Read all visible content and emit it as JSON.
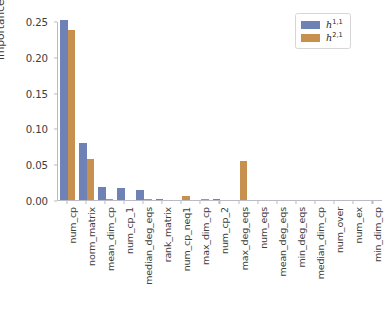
{
  "chart_data": {
    "type": "bar",
    "title": "",
    "xlabel": "",
    "ylabel": "importance (%)",
    "ylim": [
      0.0,
      0.25
    ],
    "yticks": [
      "0.00",
      "0.05",
      "0.10",
      "0.15",
      "0.20",
      "0.25"
    ],
    "ytick_values": [
      0.0,
      0.05,
      0.1,
      0.15,
      0.2,
      0.25
    ],
    "grid": false,
    "legend_position": "upper right",
    "categories": [
      "num_cp",
      "norm_matrix",
      "mean_dim_cp",
      "num_cp_1",
      "median_deg_eqs",
      "rank_matrix",
      "num_cp_neq1",
      "max_dim_cp",
      "num_cp_2",
      "max_deg_eqs",
      "num_eqs",
      "mean_deg_eqs",
      "min_deg_eqs",
      "median_dim_cp",
      "num_over",
      "num_ex",
      "min_dim_cp"
    ],
    "series": [
      {
        "name": "h^{1,1}",
        "label": "h",
        "superscript": "1,1",
        "color": "#6e82b5",
        "values": [
          0.251,
          0.079,
          0.018,
          0.017,
          0.014,
          0.002,
          0.0,
          0.0,
          0.002,
          0.0,
          0.0,
          0.0,
          0.0,
          0.0,
          0.0,
          0.0,
          0.0
        ]
      },
      {
        "name": "h^{2,1}",
        "label": "h",
        "superscript": "2,1",
        "color": "#c8904f",
        "values": [
          0.238,
          0.057,
          0.001,
          0.0,
          0.002,
          0.0,
          0.006,
          0.001,
          0.0,
          0.054,
          0.0,
          0.0,
          0.0,
          0.0,
          0.0,
          0.0,
          0.0
        ]
      }
    ]
  }
}
